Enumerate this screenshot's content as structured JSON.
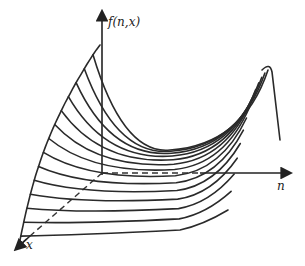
{
  "diagram": {
    "axes": {
      "vertical_label": "f(n,x)",
      "horizontal_label": "n",
      "depth_label": "x"
    },
    "curve_family": {
      "count": 14,
      "description": "family of curves f(n, x) for successive x, decaying then rising in n with oscillating bumps at large n"
    },
    "stroke_color": "#2a2a2a",
    "background": "#ffffff"
  }
}
